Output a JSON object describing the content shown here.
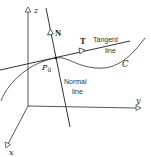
{
  "figure": {
    "type": "3d-curve-tangent-normal",
    "axes": {
      "x_label": "x",
      "y_label": "y",
      "z_label": "z"
    },
    "point": {
      "label_main": "P",
      "label_sub": "0"
    },
    "vectors": {
      "normal_label": "N",
      "tangent_label": "T"
    },
    "lines": {
      "tangent_line_label_1": "Tangent",
      "tangent_line_label_2": "line",
      "normal_line_label_1": "Normal",
      "normal_line_label_2": "line"
    },
    "curve_label": "C",
    "colors": {
      "stroke": "#333333",
      "background": "#ffffff"
    }
  }
}
